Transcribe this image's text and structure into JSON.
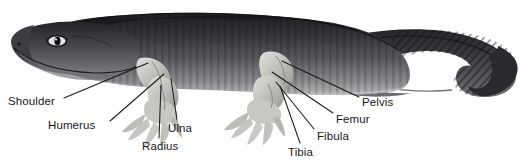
{
  "figure": {
    "background_color": "#ffffff",
    "label_color": "#17171a",
    "leader_color": "#1a1a1d",
    "body_dark": "#2b2b2e",
    "body_mid": "#57575b",
    "body_light": "#9a9a9d",
    "limb_light": "#d3d2cf",
    "limb_shade": "#a6a5a2"
  },
  "labels": [
    {
      "id": "shoulder",
      "text": "Shoulder",
      "x": 8,
      "y": 95,
      "leader": {
        "x1": 64,
        "y1": 98,
        "x2": 148,
        "y2": 63
      }
    },
    {
      "id": "humerus",
      "text": "Humerus",
      "x": 48,
      "y": 119,
      "leader": {
        "x1": 110,
        "y1": 121,
        "x2": 164,
        "y2": 74
      }
    },
    {
      "id": "radius",
      "text": "Radius",
      "x": 142,
      "y": 140,
      "leader": {
        "x1": 159,
        "y1": 138,
        "x2": 161,
        "y2": 85
      }
    },
    {
      "id": "ulna",
      "text": "Ulna",
      "x": 168,
      "y": 122,
      "leader": {
        "x1": 177,
        "y1": 120,
        "x2": 171,
        "y2": 79
      }
    },
    {
      "id": "tibia",
      "text": "Tibia",
      "x": 288,
      "y": 146,
      "leader": {
        "x1": 300,
        "y1": 143,
        "x2": 280,
        "y2": 86
      }
    },
    {
      "id": "fibula",
      "text": "Fibula",
      "x": 317,
      "y": 130,
      "leader": {
        "x1": 314,
        "y1": 129,
        "x2": 276,
        "y2": 82
      }
    },
    {
      "id": "femur",
      "text": "Femur",
      "x": 336,
      "y": 113,
      "leader": {
        "x1": 333,
        "y1": 113,
        "x2": 272,
        "y2": 72
      }
    },
    {
      "id": "pelvis",
      "text": "Pelvis",
      "x": 362,
      "y": 96,
      "leader": {
        "x1": 359,
        "y1": 97,
        "x2": 282,
        "y2": 61
      }
    }
  ]
}
